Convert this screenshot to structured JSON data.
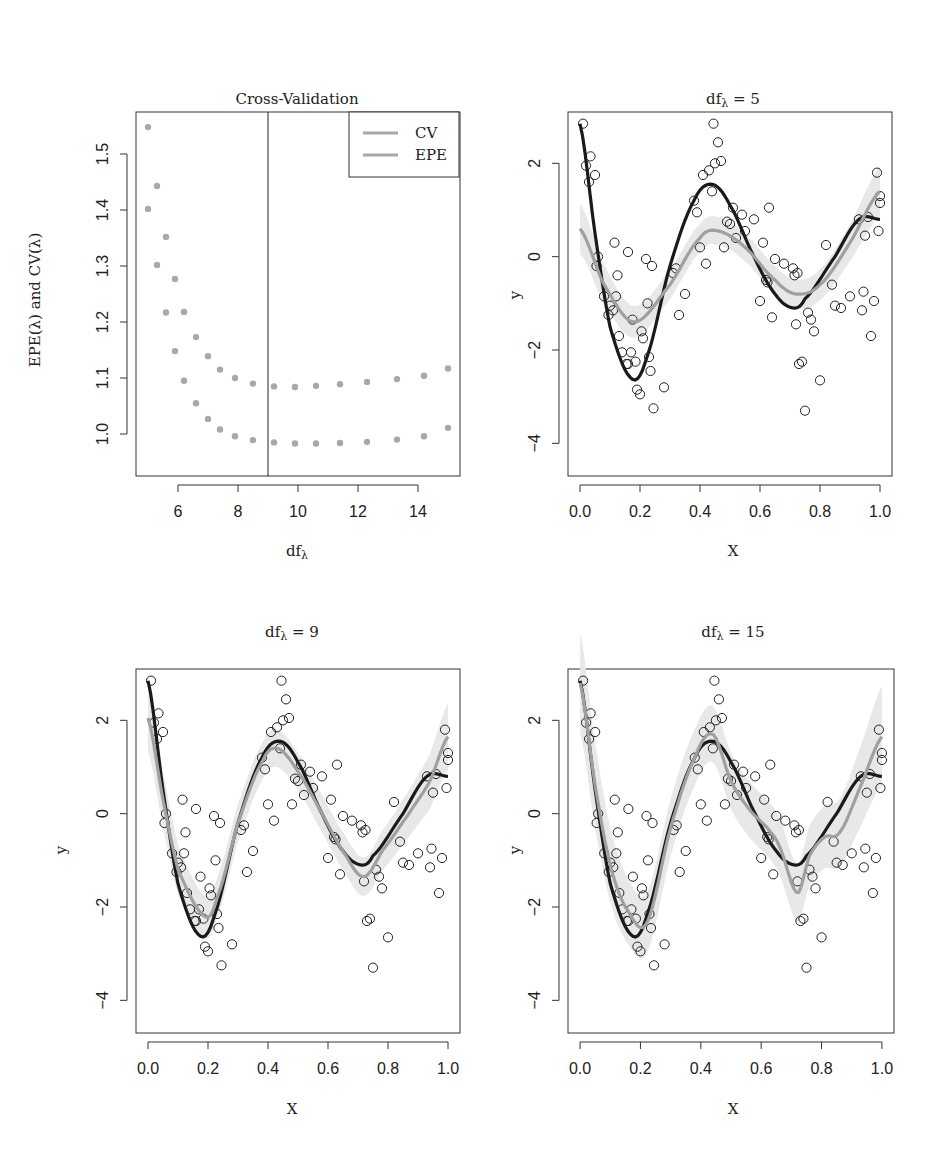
{
  "chart_data": [
    {
      "id": "cv",
      "type": "scatter",
      "title": "Cross-Validation",
      "xlabel": "df_λ",
      "ylabel": "EPE(λ) and CV(λ)",
      "xlim": [
        4.6,
        15.4
      ],
      "ylim": [
        0.925,
        1.575
      ],
      "xticks": [
        6,
        8,
        10,
        12,
        14
      ],
      "yticks": [
        1.0,
        1.1,
        1.2,
        1.3,
        1.4,
        1.5
      ],
      "vline_x": 9,
      "legend": {
        "position": "top-right",
        "entries": [
          "CV",
          "EPE"
        ]
      },
      "series": [
        {
          "name": "CV",
          "color": "#a8a8a8",
          "x": [
            5.0,
            5.3,
            5.6,
            5.9,
            6.2,
            6.6,
            7.0,
            7.4,
            7.9,
            8.5,
            9.2,
            9.9,
            10.6,
            11.4,
            12.3,
            13.3,
            14.2,
            15.0
          ],
          "y": [
            1.548,
            1.443,
            1.352,
            1.277,
            1.218,
            1.173,
            1.139,
            1.115,
            1.1,
            1.09,
            1.085,
            1.084,
            1.086,
            1.089,
            1.093,
            1.098,
            1.104,
            1.117
          ]
        },
        {
          "name": "EPE",
          "color": "#a8a8a8",
          "x": [
            5.0,
            5.3,
            5.6,
            5.9,
            6.2,
            6.6,
            7.0,
            7.4,
            7.9,
            8.5,
            9.2,
            9.9,
            10.6,
            11.4,
            12.3,
            13.3,
            14.2,
            15.0
          ],
          "y": [
            1.402,
            1.302,
            1.217,
            1.148,
            1.095,
            1.055,
            1.027,
            1.008,
            0.996,
            0.989,
            0.985,
            0.983,
            0.983,
            0.984,
            0.986,
            0.99,
            0.996,
            1.011
          ]
        }
      ]
    },
    {
      "id": "df5",
      "type": "scatter",
      "title": "df_λ = 5",
      "xlabel": "X",
      "ylabel": "y",
      "xlim": [
        -0.04,
        1.04
      ],
      "ylim": [
        -4.7,
        3.1
      ],
      "xticks": [
        0.0,
        0.2,
        0.4,
        0.6,
        0.8,
        1.0
      ],
      "yticks": [
        -4,
        -2,
        0,
        2
      ],
      "true_curve": "dark",
      "fit_df": 5,
      "band_halfwidth": 0.3
    },
    {
      "id": "df9",
      "type": "scatter",
      "title": "df_λ = 9",
      "xlabel": "X",
      "ylabel": "y",
      "xlim": [
        -0.04,
        1.04
      ],
      "ylim": [
        -4.7,
        3.1
      ],
      "xticks": [
        0.0,
        0.2,
        0.4,
        0.6,
        0.8,
        1.0
      ],
      "yticks": [
        -4,
        -2,
        0,
        2
      ],
      "true_curve": "dark",
      "fit_df": 9,
      "band_halfwidth": 0.4
    },
    {
      "id": "df15",
      "type": "scatter",
      "title": "df_λ = 15",
      "xlabel": "X",
      "ylabel": "y",
      "xlim": [
        -0.04,
        1.04
      ],
      "ylim": [
        -4.7,
        3.1
      ],
      "xticks": [
        0.0,
        0.2,
        0.4,
        0.6,
        0.8,
        1.0
      ],
      "yticks": [
        -4,
        -2,
        0,
        2
      ],
      "true_curve": "dark",
      "fit_df": 15,
      "band_halfwidth": 0.6
    }
  ],
  "points": {
    "x": [
      0.01,
      0.02,
      0.03,
      0.035,
      0.05,
      0.055,
      0.06,
      0.08,
      0.095,
      0.1,
      0.11,
      0.115,
      0.12,
      0.125,
      0.13,
      0.14,
      0.155,
      0.16,
      0.17,
      0.175,
      0.185,
      0.19,
      0.2,
      0.205,
      0.21,
      0.22,
      0.225,
      0.23,
      0.235,
      0.245,
      0.28,
      0.31,
      0.32,
      0.33,
      0.35,
      0.38,
      0.39,
      0.4,
      0.42,
      0.41,
      0.43,
      0.44,
      0.445,
      0.45,
      0.46,
      0.47,
      0.48,
      0.49,
      0.5,
      0.51,
      0.52,
      0.54,
      0.55,
      0.58,
      0.6,
      0.61,
      0.62,
      0.625,
      0.63,
      0.64,
      0.65,
      0.68,
      0.71,
      0.715,
      0.72,
      0.725,
      0.73,
      0.74,
      0.75,
      0.76,
      0.77,
      0.78,
      0.8,
      0.82,
      0.84,
      0.85,
      0.87,
      0.9,
      0.93,
      0.94,
      0.945,
      0.95,
      0.96,
      0.97,
      0.98,
      0.99,
      0.995,
      1.0,
      1.0,
      0.24,
      0.16
    ],
    "y": [
      2.85,
      1.95,
      1.6,
      2.15,
      1.75,
      -0.2,
      0.0,
      -0.85,
      -1.25,
      -1.05,
      -1.15,
      0.3,
      -0.85,
      -0.4,
      -1.7,
      -2.05,
      -2.3,
      -2.3,
      -2.05,
      -1.35,
      -2.25,
      -2.85,
      -2.95,
      -1.6,
      -1.75,
      -0.05,
      -1.0,
      -2.15,
      -2.45,
      -3.25,
      -2.8,
      -0.35,
      -0.25,
      -1.25,
      -0.8,
      1.2,
      0.95,
      0.2,
      -0.15,
      1.75,
      1.85,
      1.4,
      2.85,
      2.0,
      2.45,
      2.05,
      0.2,
      0.75,
      0.7,
      1.05,
      0.4,
      0.9,
      0.55,
      0.8,
      -0.95,
      0.3,
      -0.5,
      -0.55,
      1.05,
      -1.3,
      -0.05,
      -0.15,
      -0.25,
      -0.4,
      -1.45,
      -0.35,
      -2.3,
      -2.25,
      -3.3,
      -1.2,
      -1.35,
      -1.6,
      -2.65,
      0.25,
      -0.6,
      -1.05,
      -1.1,
      -0.85,
      0.8,
      -1.15,
      -0.75,
      0.45,
      0.85,
      -1.7,
      -0.95,
      1.8,
      0.55,
      1.3,
      1.15,
      -0.2,
      0.1,
      2.7,
      0.7,
      2.05,
      2.15,
      1.75,
      0.55,
      -4.05,
      -4.4
    ]
  },
  "colors": {
    "true_curve": "#1a1a1a",
    "fit_curve": "#a0a0a0",
    "band": "#e8e8e8",
    "points": "#222222",
    "cv_dots": "#a8a8a8",
    "axis": "#333333"
  }
}
